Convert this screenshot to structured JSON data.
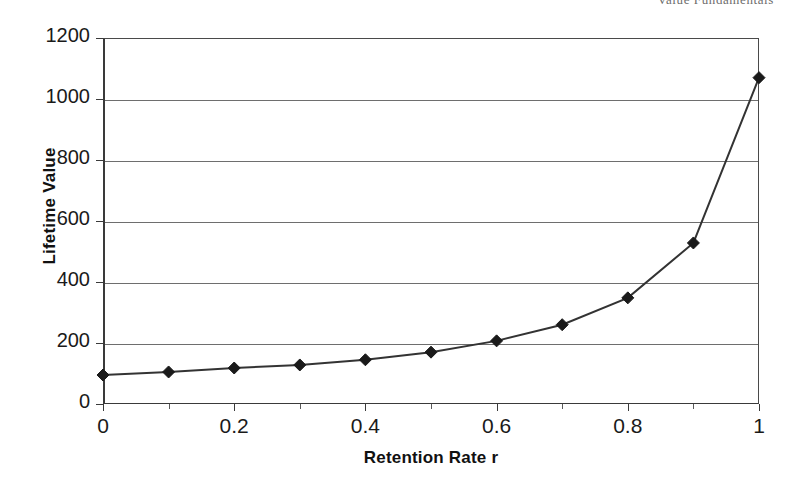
{
  "page_header": {
    "remnant_text": "Value Fundamentals"
  },
  "chart_data": {
    "type": "line",
    "title": "",
    "subtitle": "",
    "xlabel": "Retention Rate r",
    "ylabel": "Lifetime Value",
    "xlim": [
      0,
      1
    ],
    "ylim": [
      0,
      1200
    ],
    "grid": "horizontal",
    "legend": "none",
    "marker": "diamond",
    "marker_color": "#1a1a1a",
    "line_color": "#333333",
    "gridline_color": "#6e6e6e",
    "axis_color": "#3a3a3a",
    "x_tick_labels": [
      "0",
      "0.2",
      "0.4",
      "0.6",
      "0.8",
      "1"
    ],
    "x_tick_values": [
      0,
      0.2,
      0.4,
      0.6,
      0.8,
      1
    ],
    "x_minor_tick_values": [
      0.1,
      0.3,
      0.5,
      0.7,
      0.9
    ],
    "y_tick_labels": [
      "0",
      "200",
      "400",
      "600",
      "800",
      "1000",
      "1200"
    ],
    "y_tick_values": [
      0,
      200,
      400,
      600,
      800,
      1000,
      1200
    ],
    "x": [
      0,
      0.1,
      0.2,
      0.3,
      0.4,
      0.5,
      0.6,
      0.7,
      0.8,
      0.9,
      1
    ],
    "values": [
      95,
      105,
      118,
      128,
      145,
      170,
      207,
      260,
      348,
      528,
      1070
    ],
    "series": [
      {
        "name": "Lifetime Value",
        "x": [
          0,
          0.1,
          0.2,
          0.3,
          0.4,
          0.5,
          0.6,
          0.7,
          0.8,
          0.9,
          1
        ],
        "values": [
          95,
          105,
          118,
          128,
          145,
          170,
          207,
          260,
          348,
          528,
          1070
        ]
      }
    ]
  }
}
